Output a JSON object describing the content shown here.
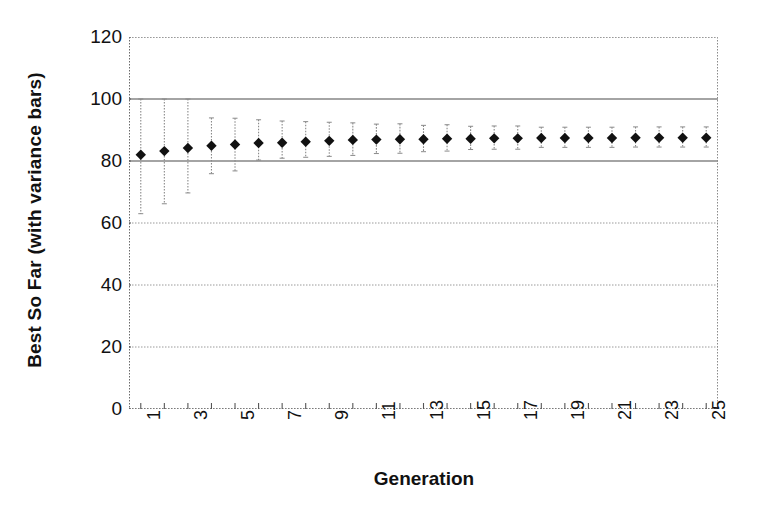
{
  "chart_data": {
    "type": "scatter",
    "title": "",
    "xlabel": "Generation",
    "ylabel": "Best So Far (with variance bars)",
    "xlim": [
      0.5,
      25.5
    ],
    "ylim": [
      0,
      120
    ],
    "grid": true,
    "legend": null,
    "yticks": [
      0,
      20,
      40,
      60,
      80,
      100,
      120
    ],
    "ytick_labels": [
      "0",
      "20",
      "40",
      "60",
      "80",
      "100",
      "120"
    ],
    "xticks": [
      1,
      2,
      3,
      4,
      5,
      6,
      7,
      8,
      9,
      10,
      11,
      12,
      13,
      14,
      15,
      16,
      17,
      18,
      19,
      20,
      21,
      22,
      23,
      24,
      25
    ],
    "xtick_labels_shown": [
      "1",
      "3",
      "5",
      "7",
      "9",
      "11",
      "13",
      "15",
      "17",
      "19",
      "21",
      "23",
      "25"
    ],
    "xtick_label_rotation": -90,
    "marker": "filled-diamond",
    "marker_color": "#111111",
    "errorbar_color": "#8a8a8a",
    "categories": [
      1,
      2,
      3,
      4,
      5,
      6,
      7,
      8,
      9,
      10,
      11,
      12,
      13,
      14,
      15,
      16,
      17,
      18,
      19,
      20,
      21,
      22,
      23,
      24,
      25
    ],
    "values": [
      82.0,
      83.2,
      84.2,
      84.9,
      85.3,
      85.8,
      85.9,
      86.2,
      86.5,
      86.8,
      86.9,
      87.0,
      87.0,
      87.2,
      87.2,
      87.3,
      87.3,
      87.4,
      87.4,
      87.4,
      87.4,
      87.5,
      87.5,
      87.5,
      87.5
    ],
    "errors_lower": [
      19.0,
      17.0,
      14.5,
      9.0,
      8.5,
      5.5,
      5.0,
      5.0,
      5.0,
      5.0,
      4.5,
      4.5,
      4.0,
      4.0,
      3.5,
      3.5,
      3.5,
      3.0,
      3.0,
      3.0,
      3.0,
      3.0,
      3.0,
      3.0,
      3.0
    ],
    "errors_upper": [
      18.0,
      16.8,
      15.8,
      9.0,
      8.5,
      7.5,
      7.0,
      6.5,
      6.0,
      5.5,
      5.0,
      5.0,
      4.5,
      4.5,
      4.0,
      4.0,
      4.0,
      3.5,
      3.5,
      3.5,
      3.5,
      3.5,
      3.5,
      3.5,
      3.5
    ],
    "series": [
      {
        "name": "Best So Far",
        "values": [
          82.0,
          83.2,
          84.2,
          84.9,
          85.3,
          85.8,
          85.9,
          86.2,
          86.5,
          86.8,
          86.9,
          87.0,
          87.0,
          87.2,
          87.2,
          87.3,
          87.3,
          87.4,
          87.4,
          87.4,
          87.4,
          87.5,
          87.5,
          87.5,
          87.5
        ]
      }
    ]
  }
}
